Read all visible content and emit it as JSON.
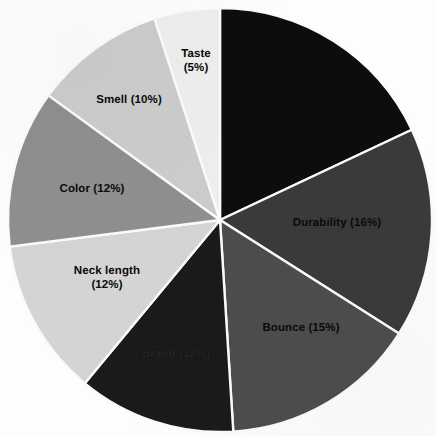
{
  "chart_data": {
    "type": "pie",
    "title": "",
    "subtitle": "",
    "xlabel": "",
    "ylabel": "",
    "legend": "none",
    "grid": false,
    "units": "percent",
    "start_angle_deg": 0,
    "direction": "clockwise",
    "categories": [
      "",
      "Durability",
      "Bounce",
      "Brand",
      "Neck length",
      "Color",
      "Smell",
      "Taste"
    ],
    "values": [
      18,
      16,
      15,
      12,
      12,
      12,
      10,
      5
    ],
    "slices": [
      {
        "name": "unlabeled-black",
        "label": "",
        "percent": 18,
        "value_text": "",
        "color": "#0d0d0d",
        "label_shown": false,
        "label_x": 0,
        "label_y": 0,
        "label_lines": []
      },
      {
        "name": "durability",
        "label": "Durability",
        "percent": 16,
        "value_text": "Durability (16%)",
        "color": "#3a3a3a",
        "label_shown": true,
        "label_x": 337,
        "label_y": 224,
        "label_lines": [
          "Durability (16%)"
        ]
      },
      {
        "name": "bounce",
        "label": "Bounce",
        "percent": 15,
        "value_text": "Bounce (15%)",
        "color": "#4d4d4d",
        "label_shown": true,
        "label_x": 301,
        "label_y": 329,
        "label_lines": [
          "Bounce (15%)"
        ]
      },
      {
        "name": "brand",
        "label": "Brand",
        "percent": 12,
        "value_text": "Brand (12%)",
        "color": "#1a1a1a",
        "label_shown": true,
        "label_x": 176,
        "label_y": 355,
        "label_lines": [
          "Brand (12%)"
        ]
      },
      {
        "name": "neck-length",
        "label": "Neck length",
        "percent": 12,
        "value_text": "Neck length (12%)",
        "color": "#d4d4d4",
        "label_shown": true,
        "label_x": 107,
        "label_y": 279,
        "label_lines": [
          "Neck length",
          "(12%)"
        ]
      },
      {
        "name": "color",
        "label": "Color",
        "percent": 12,
        "value_text": "Color (12%)",
        "color": "#8f8f8f",
        "label_shown": true,
        "label_x": 92,
        "label_y": 190,
        "label_lines": [
          "Color (12%)"
        ]
      },
      {
        "name": "smell",
        "label": "Smell",
        "percent": 10,
        "value_text": "Smell (10%)",
        "color": "#cccccc",
        "label_shown": true,
        "label_x": 129,
        "label_y": 101,
        "label_lines": [
          "Smell (10%)"
        ]
      },
      {
        "name": "taste",
        "label": "Taste",
        "percent": 5,
        "value_text": "Taste (5%)",
        "color": "#eeeeee",
        "label_shown": true,
        "label_x": 196,
        "label_y": 62,
        "label_lines": [
          "Taste",
          "(5%)"
        ]
      }
    ],
    "geometry": {
      "center_x": 220,
      "center_y": 220,
      "radius": 212
    },
    "colors": {
      "background": "#fdfdfb",
      "separator": "#fbfbf9",
      "label_text": "#0a0a0a"
    }
  }
}
